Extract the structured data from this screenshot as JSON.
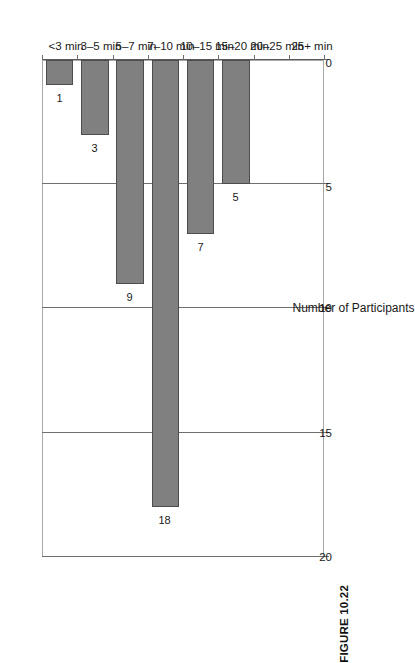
{
  "figure": {
    "caption": "FIGURE 10.22"
  },
  "chart_data": {
    "type": "bar",
    "orientation": "vertical-printed-rotated",
    "title": "",
    "subtitle": "",
    "xlabel": "",
    "ylabel": "Number of Participants",
    "categories": [
      "<3 min",
      "3–5 min",
      "5–7 min",
      "7–10 min",
      "10–15 min",
      "15–20 min",
      "20–25 min",
      "25+ min"
    ],
    "values": [
      1,
      3,
      9,
      18,
      7,
      5,
      0,
      0
    ],
    "value_labels": [
      "1",
      "3",
      "9",
      "18",
      "7",
      "5",
      "",
      ""
    ],
    "ylim": [
      0,
      20
    ],
    "yticks": [
      0,
      5,
      10,
      15,
      20
    ],
    "ytick_labels": [
      "0",
      "5",
      "10",
      "15",
      "20"
    ],
    "grid": true,
    "legend": false,
    "bar_color": "#808080",
    "bar_edge_color": "#4d4d4d",
    "axis_color": "#6f6f6f"
  }
}
